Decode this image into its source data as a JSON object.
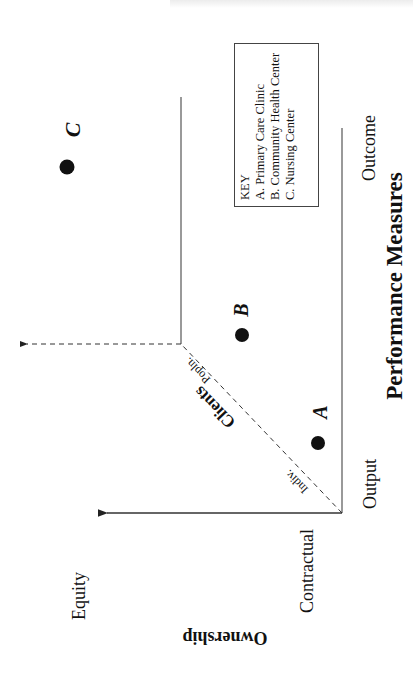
{
  "diagram": {
    "orientation": "page rotated 90° counter-clockwise (text reads bottom-to-top)",
    "x_axis": {
      "title": "Performance Measures",
      "start_label": "Output",
      "end_label": "Outcome"
    },
    "y_axis": {
      "title": "Ownership",
      "start_label": "Contractual",
      "end_label": "Equity"
    },
    "diagonal_axis": {
      "title": "Clients",
      "start_label": "Indiv.",
      "end_label": "Popln."
    },
    "points": [
      {
        "id": "A",
        "label": "A"
      },
      {
        "id": "B",
        "label": "B"
      },
      {
        "id": "C",
        "label": "C"
      }
    ],
    "key": {
      "title": "KEY",
      "items": [
        "A. Primary Care Clinic",
        "B. Community Health Center",
        "C. Nursing Center"
      ]
    },
    "colors": {
      "ink": "#111111",
      "line": "#444444",
      "background": "#ffffff"
    }
  }
}
